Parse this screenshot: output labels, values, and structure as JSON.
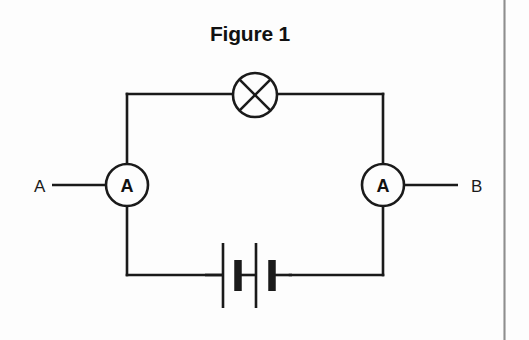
{
  "figure": {
    "title": "Figure 1",
    "background_color": "#fdfdfd",
    "line_color": "#1a1a1a",
    "scan_margin_color": "#8e8e8e"
  },
  "circuit": {
    "type": "series-circuit",
    "loop": {
      "left_x": 127,
      "right_x": 383,
      "top_y": 94,
      "bottom_y": 275
    },
    "components": [
      {
        "id": "lamp",
        "symbol": "lamp-crossed-circle",
        "label": "",
        "position": "top-wire-center",
        "cx": 255,
        "cy": 95,
        "r": 22
      },
      {
        "id": "ammeter-left",
        "symbol": "ammeter-circle",
        "label": "A",
        "position": "left-wire-middle",
        "cx": 127,
        "cy": 185,
        "r": 21
      },
      {
        "id": "ammeter-right",
        "symbol": "ammeter-circle",
        "label": "A",
        "position": "right-wire-middle",
        "cx": 383,
        "cy": 185,
        "r": 21
      },
      {
        "id": "battery",
        "symbol": "battery-two-cells",
        "label": "",
        "position": "bottom-wire-center",
        "cells": 2,
        "cx": 255,
        "cy": 275
      }
    ],
    "terminals": [
      {
        "id": "terminal-a",
        "label": "A",
        "side": "left",
        "label_x": 38,
        "lead_from_x": 52,
        "lead_to_x": 106,
        "y": 185
      },
      {
        "id": "terminal-b",
        "label": "B",
        "side": "right",
        "label_x": 474,
        "lead_from_x": 404,
        "lead_to_x": 458,
        "y": 185
      }
    ]
  }
}
